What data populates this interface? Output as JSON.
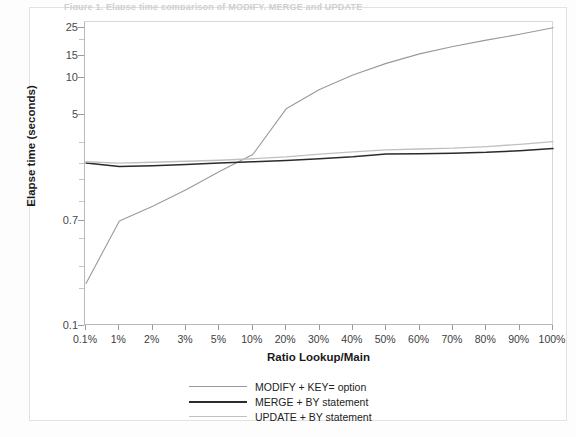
{
  "figure": {
    "clipped_caption": "Figure 1. Elapse time comparison of MODIFY, MERGE and UPDATE",
    "background": "#ffffff"
  },
  "chart_data": {
    "type": "line",
    "title": "",
    "xlabel": "Ratio Lookup/Main",
    "ylabel": "Elapse time (seconds)",
    "yscale": "log",
    "ylim": [
      0.1,
      28
    ],
    "grid": false,
    "legend_position": "bottom-center",
    "categories": [
      "0.1%",
      "1%",
      "2%",
      "3%",
      "5%",
      "10%",
      "20%",
      "30%",
      "40%",
      "50%",
      "60%",
      "70%",
      "80%",
      "90%",
      "100%"
    ],
    "ytick_labels": [
      "25",
      "15",
      "10",
      "5",
      "0.7",
      "0.1"
    ],
    "ytick_values": [
      25,
      15,
      10,
      5,
      0.7,
      0.1
    ],
    "yminor_values": [
      20,
      3,
      2,
      1.5,
      1,
      0.5,
      0.3,
      0.2
    ],
    "series": [
      {
        "name": "MODIFY + KEY= option",
        "color": "#9a9a9a",
        "width": 1.1,
        "values": [
          0.22,
          0.7,
          0.92,
          1.25,
          1.75,
          2.4,
          5.6,
          8.0,
          10.5,
          13.0,
          15.5,
          17.8,
          20.0,
          22.3,
          25.2
        ]
      },
      {
        "name": "MERGE + BY statement",
        "color": "#2b2b2b",
        "width": 1.5,
        "values": [
          2.05,
          1.92,
          1.95,
          2.0,
          2.05,
          2.1,
          2.15,
          2.22,
          2.3,
          2.42,
          2.44,
          2.46,
          2.5,
          2.58,
          2.68
        ]
      },
      {
        "name": "UPDATE + BY statement",
        "color": "#c0c0c0",
        "width": 1.3,
        "values": [
          2.1,
          2.05,
          2.08,
          2.12,
          2.16,
          2.22,
          2.3,
          2.42,
          2.52,
          2.62,
          2.66,
          2.7,
          2.78,
          2.9,
          3.05
        ]
      }
    ]
  }
}
